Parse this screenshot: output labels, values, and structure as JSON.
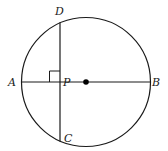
{
  "diagram": {
    "type": "geometry",
    "circle": {
      "cx": 86,
      "cy": 82,
      "r": 64.5,
      "stroke": "#1a1a1a"
    },
    "center_point": {
      "x": 86,
      "y": 82,
      "r": 2.8,
      "fill": "#000000"
    },
    "diameter": {
      "from": "A",
      "to": "B"
    },
    "chord": {
      "from": "D",
      "to": "C"
    },
    "right_angle_marker": {
      "at": "P",
      "size": 8
    },
    "labels": {
      "A": "A",
      "B": "B",
      "C": "C",
      "D": "D",
      "P": "P"
    }
  }
}
